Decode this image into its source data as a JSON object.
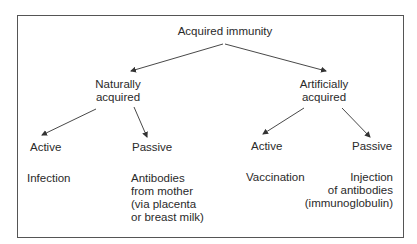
{
  "diagram": {
    "root": "Acquired immunity",
    "branches": [
      {
        "label_line1": "Naturally",
        "label_line2": "acquired",
        "children": [
          {
            "type": "Active",
            "example_lines": [
              "Infection"
            ]
          },
          {
            "type": "Passive",
            "example_lines": [
              "Antibodies",
              "from mother",
              "(via placenta",
              "or breast milk)"
            ]
          }
        ]
      },
      {
        "label_line1": "Artificially",
        "label_line2": "acquired",
        "children": [
          {
            "type": "Active",
            "example_lines": [
              "Vaccination"
            ]
          },
          {
            "type": "Passive",
            "example_lines": [
              "Injection",
              "of antibodies",
              "(immunoglobulin)"
            ]
          }
        ]
      }
    ],
    "colors": {
      "line": "#333333",
      "text": "#2a2a2a",
      "border": "#555555"
    }
  }
}
